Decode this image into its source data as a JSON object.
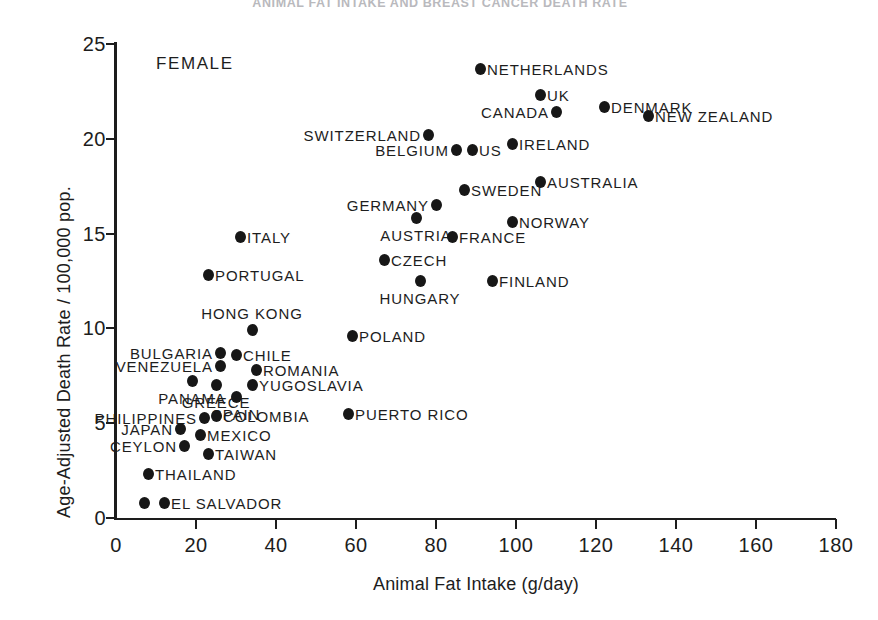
{
  "figure": {
    "cutoff_title": "ANIMAL FAT INTAKE AND BREAST CANCER DEATH RATE",
    "group_annotation": "FEMALE"
  },
  "chart_data": {
    "type": "scatter",
    "title": "",
    "xlabel": "Animal Fat Intake (g/day)",
    "ylabel": "Age-Adjusted Death Rate / 100,000 pop.",
    "xlim": [
      0,
      180
    ],
    "ylim": [
      0,
      25
    ],
    "xticks": [
      0,
      20,
      40,
      60,
      80,
      100,
      120,
      140,
      160,
      180
    ],
    "yticks": [
      0,
      5,
      10,
      15,
      20,
      25
    ],
    "grid": false,
    "legend": "none",
    "annotation": "FEMALE",
    "points": [
      {
        "label": "NETHERLANDS",
        "x": 91,
        "y": 23.7,
        "pos": "right"
      },
      {
        "label": "UK",
        "x": 106,
        "y": 22.3,
        "pos": "right"
      },
      {
        "label": "DENMARK",
        "x": 122,
        "y": 21.7,
        "pos": "right"
      },
      {
        "label": "CANADA",
        "x": 110,
        "y": 21.4,
        "pos": "left"
      },
      {
        "label": "NEW ZEALAND",
        "x": 133,
        "y": 21.2,
        "pos": "right"
      },
      {
        "label": "SWITZERLAND",
        "x": 78,
        "y": 20.2,
        "pos": "left"
      },
      {
        "label": "IRELAND",
        "x": 99,
        "y": 19.7,
        "pos": "right"
      },
      {
        "label": "BELGIUM",
        "x": 85,
        "y": 19.4,
        "pos": "left"
      },
      {
        "label": "US",
        "x": 89,
        "y": 19.4,
        "pos": "right"
      },
      {
        "label": "AUSTRALIA",
        "x": 106,
        "y": 17.7,
        "pos": "right"
      },
      {
        "label": "SWEDEN",
        "x": 87,
        "y": 17.3,
        "pos": "right"
      },
      {
        "label": "GERMANY",
        "x": 80,
        "y": 16.5,
        "pos": "left"
      },
      {
        "label": "AUSTRIA",
        "x": 75,
        "y": 15.8,
        "pos": "below"
      },
      {
        "label": "NORWAY",
        "x": 99,
        "y": 15.6,
        "pos": "right"
      },
      {
        "label": "FRANCE",
        "x": 84,
        "y": 14.8,
        "pos": "right"
      },
      {
        "label": "ITALY",
        "x": 31,
        "y": 14.8,
        "pos": "right"
      },
      {
        "label": "CZECH",
        "x": 67,
        "y": 13.6,
        "pos": "right"
      },
      {
        "label": "PORTUGAL",
        "x": 23,
        "y": 12.8,
        "pos": "right"
      },
      {
        "label": "HUNGARY",
        "x": 76,
        "y": 12.5,
        "pos": "below"
      },
      {
        "label": "FINLAND",
        "x": 94,
        "y": 12.5,
        "pos": "right"
      },
      {
        "label": "HONG KONG",
        "x": 34,
        "y": 9.9,
        "pos": "above"
      },
      {
        "label": "POLAND",
        "x": 59,
        "y": 9.6,
        "pos": "right"
      },
      {
        "label": "BULGARIA",
        "x": 26,
        "y": 8.7,
        "pos": "left"
      },
      {
        "label": "CHILE",
        "x": 30,
        "y": 8.6,
        "pos": "right"
      },
      {
        "label": "VENEZUELA",
        "x": 26,
        "y": 8.0,
        "pos": "left"
      },
      {
        "label": "ROMANIA",
        "x": 35,
        "y": 7.8,
        "pos": "right"
      },
      {
        "label": "PANAMA",
        "x": 19,
        "y": 7.2,
        "pos": "below"
      },
      {
        "label": "GREECE",
        "x": 25,
        "y": 7.0,
        "pos": "below"
      },
      {
        "label": "YUGOSLAVIA",
        "x": 34,
        "y": 7.0,
        "pos": "right"
      },
      {
        "label": "SPAIN",
        "x": 30,
        "y": 6.4,
        "pos": "below"
      },
      {
        "label": "COLOMBIA",
        "x": 25,
        "y": 5.4,
        "pos": "right"
      },
      {
        "label": "PHILIPPINES",
        "x": 22,
        "y": 5.3,
        "pos": "left"
      },
      {
        "label": "PUERTO RICO",
        "x": 58,
        "y": 5.5,
        "pos": "right"
      },
      {
        "label": "MEXICO",
        "x": 21,
        "y": 4.4,
        "pos": "right"
      },
      {
        "label": "JAPAN",
        "x": 16,
        "y": 4.7,
        "pos": "left"
      },
      {
        "label": "CEYLON",
        "x": 17,
        "y": 3.8,
        "pos": "left"
      },
      {
        "label": "TAIWAN",
        "x": 23,
        "y": 3.4,
        "pos": "right"
      },
      {
        "label": "THAILAND",
        "x": 8,
        "y": 2.3,
        "pos": "right"
      },
      {
        "label": "EL SALVADOR",
        "x": 12,
        "y": 0.8,
        "pos": "right"
      },
      {
        "label": "",
        "x": 7,
        "y": 0.8,
        "pos": "none"
      }
    ]
  }
}
